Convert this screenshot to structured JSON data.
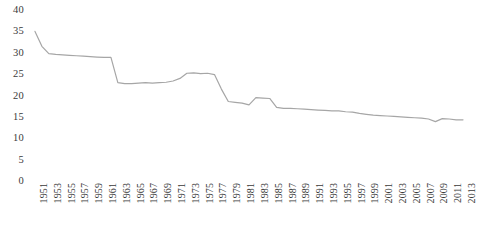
{
  "chart_data": {
    "type": "line",
    "title": "",
    "subtitle": "",
    "xlabel": "",
    "ylabel": "",
    "ylim": [
      0,
      40
    ],
    "yticks": [
      0,
      5,
      10,
      15,
      20,
      25,
      30,
      35,
      40
    ],
    "ytick_labels": [
      "0",
      "5",
      "10",
      "15",
      "20",
      "25",
      "30",
      "35",
      "40"
    ],
    "xlim": [
      1951,
      2013
    ],
    "xticks": [
      1951,
      1953,
      1955,
      1957,
      1959,
      1961,
      1963,
      1965,
      1967,
      1969,
      1971,
      1973,
      1975,
      1977,
      1979,
      1981,
      1983,
      1985,
      1987,
      1989,
      1991,
      1993,
      1995,
      1997,
      1999,
      2001,
      2003,
      2005,
      2007,
      2009,
      2011,
      2013
    ],
    "xtick_labels": [
      "1951",
      "1953",
      "1955",
      "1957",
      "1959",
      "1961",
      "1963",
      "1965",
      "1967",
      "1969",
      "1971",
      "1973",
      "1975",
      "1977",
      "1979",
      "1981",
      "1983",
      "1985",
      "1987",
      "1989",
      "1991",
      "1993",
      "1995",
      "1997",
      "1999",
      "2001",
      "2003",
      "2005",
      "2007",
      "2009",
      "2011",
      "2013"
    ],
    "xtick_rotation": -90,
    "grid": false,
    "legend": null,
    "legend_position": "none",
    "line_color": "#a6a6a6",
    "line_width": 1.2,
    "markers": false,
    "x": [
      1951,
      1952,
      1953,
      1954,
      1955,
      1956,
      1957,
      1958,
      1959,
      1960,
      1961,
      1962,
      1963,
      1964,
      1965,
      1966,
      1967,
      1968,
      1969,
      1970,
      1971,
      1972,
      1973,
      1974,
      1975,
      1976,
      1977,
      1978,
      1979,
      1980,
      1981,
      1982,
      1983,
      1984,
      1985,
      1986,
      1987,
      1988,
      1989,
      1990,
      1991,
      1992,
      1993,
      1994,
      1995,
      1996,
      1997,
      1998,
      1999,
      2000,
      2001,
      2002,
      2003,
      2004,
      2005,
      2006,
      2007,
      2008,
      2009,
      2010,
      2011,
      2012,
      2013
    ],
    "values": [
      35.0,
      31.5,
      29.8,
      29.6,
      29.5,
      29.4,
      29.3,
      29.2,
      29.1,
      29.0,
      28.9,
      28.9,
      23.0,
      22.8,
      22.8,
      22.9,
      23.0,
      22.9,
      23.0,
      23.1,
      23.4,
      24.0,
      25.2,
      25.3,
      25.1,
      25.2,
      24.9,
      21.5,
      18.6,
      18.4,
      18.2,
      17.8,
      19.5,
      19.4,
      19.3,
      17.2,
      17.0,
      17.0,
      16.9,
      16.8,
      16.7,
      16.6,
      16.5,
      16.4,
      16.4,
      16.2,
      16.1,
      15.8,
      15.6,
      15.4,
      15.3,
      15.2,
      15.1,
      15.0,
      14.9,
      14.8,
      14.7,
      14.5,
      13.9,
      14.6,
      14.5,
      14.3,
      14.3
    ],
    "series": [
      {
        "name": "",
        "values": [
          35.0,
          31.5,
          29.8,
          29.6,
          29.5,
          29.4,
          29.3,
          29.2,
          29.1,
          29.0,
          28.9,
          28.9,
          23.0,
          22.8,
          22.8,
          22.9,
          23.0,
          22.9,
          23.0,
          23.1,
          23.4,
          24.0,
          25.2,
          25.3,
          25.1,
          25.2,
          24.9,
          21.5,
          18.6,
          18.4,
          18.2,
          17.8,
          19.5,
          19.4,
          19.3,
          17.2,
          17.0,
          17.0,
          16.9,
          16.8,
          16.7,
          16.6,
          16.5,
          16.4,
          16.4,
          16.2,
          16.1,
          15.8,
          15.6,
          15.4,
          15.3,
          15.2,
          15.1,
          15.0,
          14.9,
          14.8,
          14.7,
          14.5,
          13.9,
          14.6,
          14.5,
          14.3,
          14.3
        ]
      }
    ]
  },
  "colors": {
    "line": "#a6a6a6",
    "text": "#3a3a3a",
    "background": "#ffffff"
  }
}
